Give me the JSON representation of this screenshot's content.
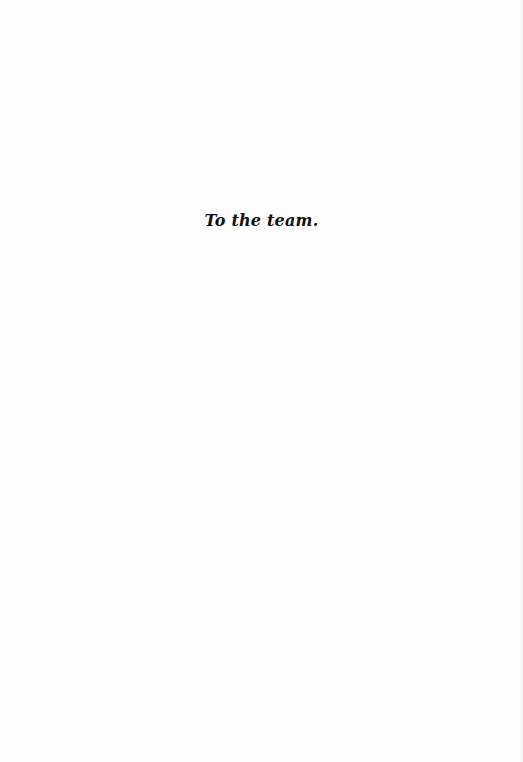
{
  "page": {
    "dedication": "To the team."
  }
}
